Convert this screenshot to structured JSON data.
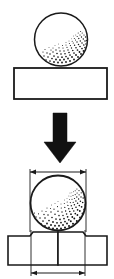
{
  "figure": {
    "title": "Ball indentation test diagram",
    "background_color": "#ffffff",
    "line_color": "#1a1a1a",
    "fill_color": "#ffffff",
    "stipple_color": "#141414",
    "arrow_color": "#111111"
  },
  "stage_before": {
    "label": "before-indentation",
    "sphere": {
      "name": "ball-indenter",
      "cx": 61,
      "cy": 39.5,
      "r": 26.5,
      "stipple_region": "lower-right",
      "stipple_dot_count": 150
    },
    "specimen": {
      "name": "flat-specimen-plate",
      "x": 14,
      "y": 68,
      "width": 93,
      "height": 31
    }
  },
  "transition": {
    "arrow": {
      "name": "load-direction-arrow",
      "direction": "down",
      "shaft_x": 53,
      "shaft_y": 113,
      "shaft_width": 14,
      "shaft_height": 29,
      "head_left": 44,
      "head_right": 76,
      "head_tip_y": 163
    }
  },
  "stage_after": {
    "label": "after-indentation",
    "sphere": {
      "name": "ball-indenter-pressed",
      "cx": 58,
      "cy": 203,
      "r": 27.5,
      "stipple_region": "lower-right",
      "stipple_dot_count": 165
    },
    "specimen": {
      "name": "deformed-specimen-plate",
      "left_block": {
        "x": 8,
        "y": 232,
        "width": 50,
        "height": 33
      },
      "right_block": {
        "x": 58,
        "y": 232,
        "width": 49,
        "height": 33
      },
      "pileup_left_x": 30,
      "pileup_right_x": 86,
      "top_y": 232,
      "bottom_y": 265
    },
    "dimension_ball": {
      "name": "ball-diameter-dimension",
      "y": 172,
      "x1": 30,
      "x2": 86,
      "extension_top": 169,
      "extension_bottom": 232,
      "value": ""
    },
    "dimension_indent": {
      "name": "indent-width-dimension",
      "y": 273,
      "x1": 31,
      "x2": 85,
      "extension_top": 230,
      "extension_bottom": 276,
      "value": ""
    }
  }
}
